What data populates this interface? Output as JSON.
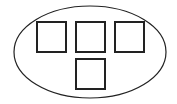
{
  "diagram": {
    "container": {
      "shape": "ellipse",
      "cx": 90,
      "cy": 52,
      "rx": 76,
      "ry": 46,
      "stroke": "#222222"
    },
    "boxes": [
      {
        "x": 37,
        "y": 22,
        "w": 29,
        "h": 30
      },
      {
        "x": 76,
        "y": 22,
        "w": 29,
        "h": 30
      },
      {
        "x": 115,
        "y": 22,
        "w": 29,
        "h": 30
      },
      {
        "x": 76,
        "y": 59,
        "w": 29,
        "h": 30
      }
    ],
    "box_stroke": "#222222"
  }
}
